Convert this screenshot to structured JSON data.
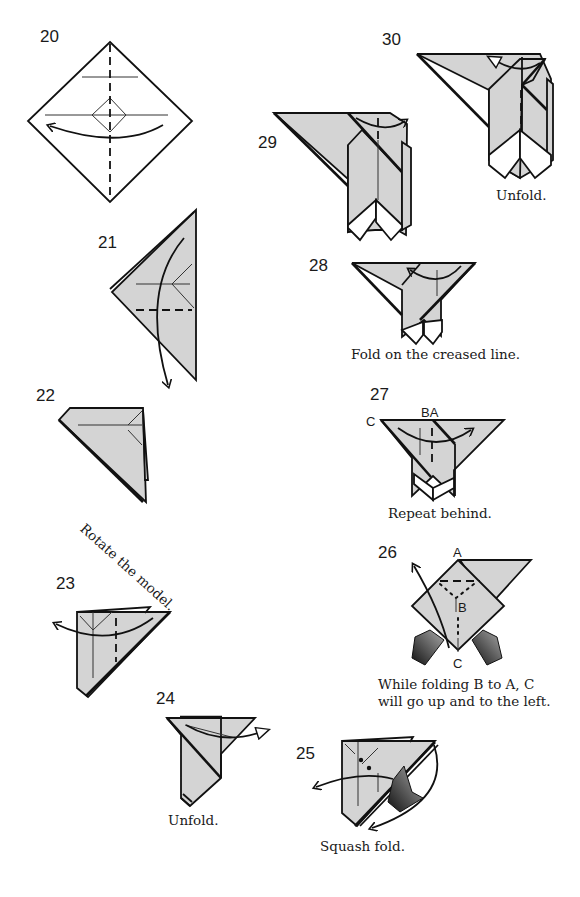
{
  "steps": [
    {
      "number": "20",
      "caption": ""
    },
    {
      "number": "21",
      "caption": ""
    },
    {
      "number": "22",
      "caption": "Rotate the model."
    },
    {
      "number": "23",
      "caption": ""
    },
    {
      "number": "24",
      "caption": "Unfold."
    },
    {
      "number": "25",
      "caption": "Squash fold."
    },
    {
      "number": "26",
      "caption_line1": "While folding B to A, C",
      "caption_line2": "will go up and to the left.",
      "labels": {
        "a": "A",
        "b": "B",
        "c": "C"
      }
    },
    {
      "number": "27",
      "caption": "Repeat behind.",
      "labels": {
        "ba": "BA",
        "c": "C"
      }
    },
    {
      "number": "28",
      "caption": "Fold on the creased line."
    },
    {
      "number": "29",
      "caption": ""
    },
    {
      "number": "30",
      "caption": "Unfold."
    }
  ],
  "colors": {
    "paper": "#d4d4d4",
    "line": "#111111",
    "background": "#ffffff"
  }
}
